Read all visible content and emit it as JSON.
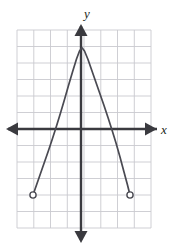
{
  "figure": {
    "kind": "coordinate-plane-graph",
    "background_color": "#ffffff",
    "grid_color": "#c9c9cf",
    "axis_color": "#3a3a3f",
    "curve_color": "#4a4a52"
  },
  "axes": {
    "x_label": "x",
    "y_label": "y",
    "origin_px": [
      81,
      129
    ],
    "x_axis_arrows": "both",
    "y_axis_arrows": "both"
  },
  "grid": {
    "left_px": 17,
    "top_px": 30,
    "right_px": 151,
    "bottom_px": 228,
    "cell_px": 16.75,
    "columns": 8,
    "rows": 11.8,
    "visible": true
  },
  "chart_data": {
    "type": "line",
    "title": "",
    "xlabel": "x",
    "ylabel": "y",
    "grid": true,
    "legend": null,
    "xlim": [
      -3.82,
      4.18
    ],
    "ylim": [
      -5.91,
      5.91
    ],
    "series": [
      {
        "name": "downward-opening parabola segment",
        "equation": "y = -(4/3)x^2 + 4.8",
        "domain": [
          -2.87,
          2.93
        ],
        "open_endpoints": [
          {
            "x": -2.87,
            "y": -4.0,
            "marker": "open-circle"
          },
          {
            "x": 2.93,
            "y": -4.0,
            "marker": "open-circle"
          }
        ],
        "vertex": {
          "x": 0.05,
          "y": 4.84
        },
        "points_px": [
          [
            33.0,
            195.0
          ],
          [
            36.5,
            185.0
          ],
          [
            40.5,
            173.5
          ],
          [
            44.5,
            162.0
          ],
          [
            48.5,
            150.5
          ],
          [
            52.5,
            138.5
          ],
          [
            56.5,
            126.0
          ],
          [
            60.5,
            113.0
          ],
          [
            64.5,
            99.5
          ],
          [
            68.5,
            85.5
          ],
          [
            72.5,
            72.0
          ],
          [
            76.5,
            59.0
          ],
          [
            79.5,
            51.0
          ],
          [
            82.0,
            47.8
          ],
          [
            84.5,
            51.0
          ],
          [
            88.0,
            59.5
          ],
          [
            92.0,
            71.0
          ],
          [
            96.0,
            82.5
          ],
          [
            100.0,
            94.0
          ],
          [
            104.0,
            105.5
          ],
          [
            108.0,
            117.5
          ],
          [
            112.0,
            130.0
          ],
          [
            116.0,
            143.0
          ],
          [
            120.0,
            157.0
          ],
          [
            124.0,
            172.0
          ],
          [
            127.5,
            185.0
          ],
          [
            130.0,
            195.0
          ]
        ]
      }
    ],
    "categories": [],
    "values": []
  }
}
